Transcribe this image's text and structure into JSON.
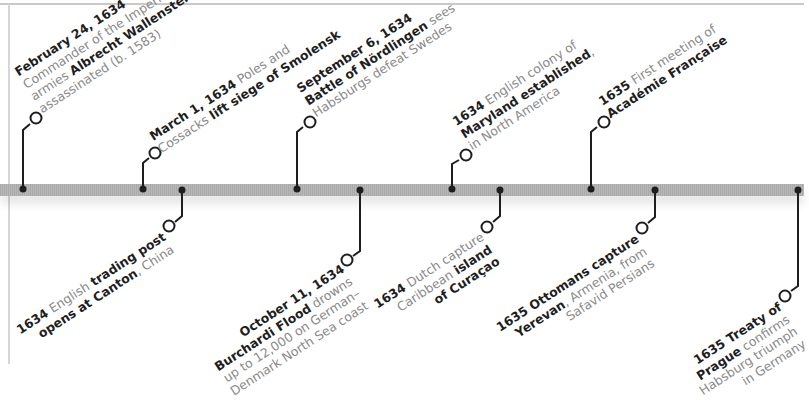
{
  "colors": {
    "line": "#1e1e1e",
    "bar": "#b0b0b0",
    "text_bold": "#1e1e1e",
    "text_light": "#8a8a8a"
  },
  "events": [
    {
      "id": "wallenstein",
      "side": "above",
      "lines": [
        [
          {
            "b": "February 24, 1634"
          }
        ],
        [
          {
            "t": "Commander of the Imperial"
          }
        ],
        [
          {
            "t": "armies "
          },
          {
            "b": "Albrecht Wallenstein"
          }
        ],
        [
          {
            "t": "assassinated (b. 1583)"
          }
        ]
      ]
    },
    {
      "id": "smolensk",
      "side": "above",
      "lines": [
        [
          {
            "b": "March 1, 1634"
          },
          {
            "t": " Poles and"
          }
        ],
        [
          {
            "t": "Cossacks "
          },
          {
            "b": "lift siege of Smolensk"
          }
        ]
      ]
    },
    {
      "id": "canton",
      "side": "below",
      "lines": [
        [
          {
            "b": "1634"
          },
          {
            "t": " English "
          },
          {
            "b": "trading post"
          }
        ],
        [
          {
            "b": "opens at Canton"
          },
          {
            "t": ", China"
          }
        ]
      ]
    },
    {
      "id": "nordlingen",
      "side": "above",
      "lines": [
        [
          {
            "b": "September 6, 1634"
          }
        ],
        [
          {
            "b": "Battle of Nördlingen"
          },
          {
            "t": " sees"
          }
        ],
        [
          {
            "t": "Habsburgs defeat Swedes"
          }
        ]
      ]
    },
    {
      "id": "burchardi",
      "side": "below",
      "lines": [
        [
          {
            "b": "October 11, 1634"
          }
        ],
        [
          {
            "b": "Burchardi Flood"
          },
          {
            "t": " drowns"
          }
        ],
        [
          {
            "t": "up to 12,000 on German–"
          }
        ],
        [
          {
            "t": "Denmark North Sea coast"
          }
        ]
      ]
    },
    {
      "id": "maryland",
      "side": "above",
      "lines": [
        [
          {
            "b": "1634"
          },
          {
            "t": " English colony of"
          }
        ],
        [
          {
            "b": "Maryland established"
          },
          {
            "t": ","
          }
        ],
        [
          {
            "t": "in North America"
          }
        ]
      ]
    },
    {
      "id": "curacao",
      "side": "below",
      "lines": [
        [
          {
            "b": "1634"
          },
          {
            "t": " Dutch capture"
          }
        ],
        [
          {
            "t": "Caribbean "
          },
          {
            "b": "island"
          }
        ],
        [
          {
            "b": "of Curaçao"
          }
        ]
      ]
    },
    {
      "id": "academie",
      "side": "above",
      "lines": [
        [
          {
            "b": "1635"
          },
          {
            "t": " First meeting of"
          }
        ],
        [
          {
            "b": "Académie Française"
          }
        ]
      ]
    },
    {
      "id": "yerevan",
      "side": "below",
      "lines": [
        [
          {
            "b": "1635 Ottomans capture"
          }
        ],
        [
          {
            "b": "Yerevan"
          },
          {
            "t": ", Armenia, from"
          }
        ],
        [
          {
            "t": "Safavid Persians"
          }
        ]
      ]
    },
    {
      "id": "prague",
      "side": "below",
      "lines": [
        [
          {
            "b": "1635 Treaty of"
          }
        ],
        [
          {
            "b": "Prague"
          },
          {
            "t": " confirms"
          }
        ],
        [
          {
            "t": "Habsburg triumph"
          }
        ],
        [
          {
            "t": "in Germany"
          }
        ]
      ]
    }
  ]
}
